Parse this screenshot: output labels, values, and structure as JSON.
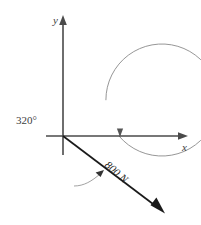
{
  "figure": {
    "background_color": "#ffffff",
    "axes": {
      "x_label": "x",
      "y_label": "y",
      "axis_color": "#4a4a4a",
      "origin": {
        "x": 63,
        "y": 136
      },
      "x_axis_end": {
        "x": 187,
        "y": 136
      },
      "y_axis_end": {
        "x": 63,
        "y": 17
      }
    },
    "angle": {
      "label": "320°",
      "value": 320,
      "unit": "degrees",
      "arc_color": "#8a8a8a",
      "arc_radius": 56,
      "direction": "counterclockwise",
      "terminates_on": "positive-x-axis"
    },
    "force": {
      "label": "800 N",
      "magnitude": 800,
      "unit": "N",
      "direction_deg": 320,
      "vector_color": "#1a1a1a",
      "start": {
        "x": 63,
        "y": 136
      },
      "end": {
        "x": 163,
        "y": 212
      },
      "label_rotation_deg": 41
    }
  }
}
